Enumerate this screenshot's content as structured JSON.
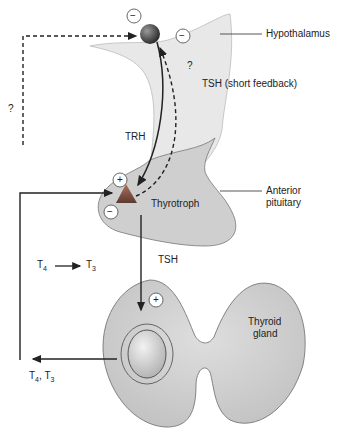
{
  "labels": {
    "hypothalamus": "Hypothalamus",
    "tsh_short_feedback": "TSH (short feedback)",
    "question_top": "?",
    "question_left": "?",
    "trh": "TRH",
    "anterior_pituitary_line1": "Anterior",
    "anterior_pituitary_line2": "pituitary",
    "thyrotroph": "Thyrotroph",
    "tsh": "TSH",
    "t4_conversion_from": "T",
    "t4_conversion_from_sub": "4",
    "t4_conversion_to": "T",
    "t4_conversion_to_sub": "3",
    "thyroid_line1": "Thyroid",
    "thyroid_line2": "gland",
    "output_t4": "T",
    "output_t4_sub": "4",
    "output_sep": ", T",
    "output_t3_sub": "3"
  },
  "signs": {
    "hypothalamus_top": "−",
    "hypothalamus_right": "−",
    "thyrotroph_plus": "+",
    "thyrotroph_minus": "−",
    "thyroid_plus": "+"
  },
  "colors": {
    "hypothalamus_fill": "#e8e8e8",
    "pituitary_fill": "#cfcfcf",
    "thyroid_fill": "#c6c6c6",
    "thyrotroph": "#8a5a4a",
    "neuron": "#555555",
    "line": "#222222"
  }
}
